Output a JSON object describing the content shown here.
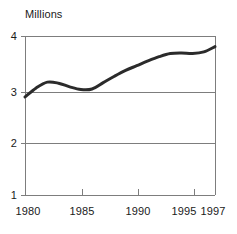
{
  "chart_data": {
    "type": "line",
    "title": "Millions",
    "subtitle": "",
    "xlabel": "",
    "ylabel": "Millions",
    "xlim": [
      1980,
      1997
    ],
    "ylim": [
      1,
      4
    ],
    "grid": "horizontal",
    "legend": "none",
    "y_ticks": [
      "4",
      "3",
      "2",
      "1"
    ],
    "y_tick_values": [
      4,
      3,
      2,
      1
    ],
    "x_ticks": [
      "1980",
      "1985",
      "1990",
      "1995",
      "1997"
    ],
    "x_tick_values": [
      1980,
      1985,
      1990,
      1995,
      1997
    ],
    "line_color": "#2b2b2b",
    "frame_color": "#7d7d7d",
    "grid_color": "#7d7d7d",
    "x": [
      1980,
      1981,
      1982,
      1983,
      1984,
      1985,
      1986,
      1987,
      1988,
      1989,
      1990,
      1991,
      1992,
      1993,
      1994,
      1995,
      1996,
      1997
    ],
    "values": [
      2.85,
      3.02,
      3.13,
      3.11,
      3.04,
      2.99,
      3.0,
      3.12,
      3.24,
      3.35,
      3.44,
      3.53,
      3.61,
      3.67,
      3.68,
      3.67,
      3.7,
      3.8
    ],
    "series": [
      {
        "name": "Millions",
        "values": [
          2.85,
          3.02,
          3.13,
          3.11,
          3.04,
          2.99,
          3.0,
          3.12,
          3.24,
          3.35,
          3.44,
          3.53,
          3.61,
          3.67,
          3.68,
          3.67,
          3.7,
          3.8
        ]
      }
    ]
  }
}
